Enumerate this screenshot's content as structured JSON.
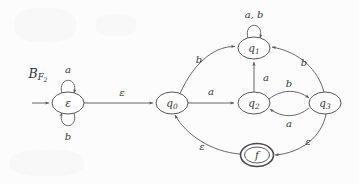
{
  "figure": {
    "machine_label": {
      "base": "B",
      "script_subscript": "F",
      "numeric_subscript": "2"
    },
    "type": "finite-automaton-diagram"
  },
  "states": [
    {
      "id": "eps",
      "label": "ε",
      "cx": 68,
      "cy": 103,
      "rx": 16,
      "ry": 11,
      "accepting": false,
      "initial": true
    },
    {
      "id": "q0",
      "label": "q",
      "sub": "0",
      "cx": 172,
      "cy": 103,
      "rx": 16,
      "ry": 11,
      "accepting": false,
      "initial": false
    },
    {
      "id": "q1",
      "label": "q",
      "sub": "1",
      "cx": 254,
      "cy": 48,
      "rx": 16,
      "ry": 11,
      "accepting": false,
      "initial": false
    },
    {
      "id": "q2",
      "label": "q",
      "sub": "2",
      "cx": 254,
      "cy": 103,
      "rx": 16,
      "ry": 11,
      "accepting": false,
      "initial": false
    },
    {
      "id": "q3",
      "label": "q",
      "sub": "3",
      "cx": 325,
      "cy": 103,
      "rx": 16,
      "ry": 11,
      "accepting": false,
      "initial": false
    },
    {
      "id": "f",
      "label": "f",
      "cx": 257,
      "cy": 155,
      "rx": 15,
      "ry": 10.5,
      "accepting": true,
      "initial": false
    }
  ],
  "transitions": [
    {
      "from": "start",
      "to": "eps",
      "label": "",
      "kind": "start-arrow"
    },
    {
      "from": "eps",
      "to": "eps",
      "label": "a",
      "kind": "self-loop-top"
    },
    {
      "from": "eps",
      "to": "eps",
      "label": "b",
      "kind": "self-loop-bottom"
    },
    {
      "from": "eps",
      "to": "q0",
      "label": "ε",
      "kind": "straight"
    },
    {
      "from": "q0",
      "to": "q1",
      "label": "b",
      "kind": "arc-up"
    },
    {
      "from": "q0",
      "to": "q2",
      "label": "a",
      "kind": "straight"
    },
    {
      "from": "q2",
      "to": "q1",
      "label": "a",
      "kind": "vertical"
    },
    {
      "from": "q1",
      "to": "q1",
      "label": "a, b",
      "kind": "self-loop-top"
    },
    {
      "from": "q2",
      "to": "q3",
      "label": "b",
      "kind": "arc-over"
    },
    {
      "from": "q3",
      "to": "q2",
      "label": "a",
      "kind": "arc-under"
    },
    {
      "from": "q3",
      "to": "q1",
      "label": "b",
      "kind": "arc-up-right"
    },
    {
      "from": "q3",
      "to": "f",
      "label": "ε",
      "kind": "arc-down-right"
    },
    {
      "from": "f",
      "to": "q0",
      "label": "ε",
      "kind": "arc-down-left"
    }
  ],
  "alphabet": [
    "a",
    "b",
    "ε"
  ],
  "colors": {
    "stroke": "#55565a",
    "text": "#333438",
    "background": "#fcfcfc",
    "accept_stroke": "#4a4b4f"
  }
}
